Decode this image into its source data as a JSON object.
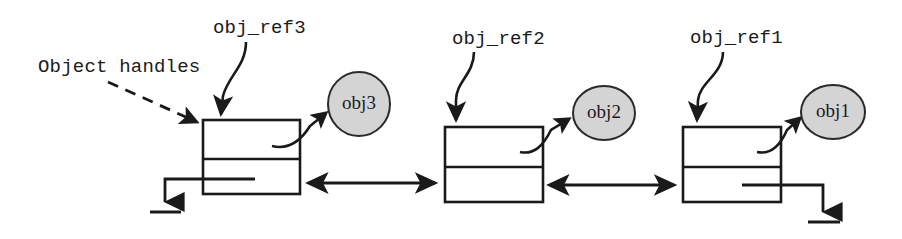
{
  "diagram": {
    "canvas": {
      "width": 902,
      "height": 239,
      "background": "#ffffff"
    },
    "colors": {
      "stroke": "#1a1a1a",
      "node_fill": "#d4d4d4",
      "node_stroke": "#2a2a2a",
      "box_fill": "#ffffff",
      "page_background": "#ffffff"
    },
    "annotations": {
      "object_handles": {
        "text": "Object handles",
        "x": 38,
        "y": 72,
        "points_to": "handle-box-3"
      }
    },
    "reference_labels": [
      {
        "id": "obj_ref3",
        "text": "obj_ref3",
        "x": 213,
        "y": 33
      },
      {
        "id": "obj_ref2",
        "text": "obj_ref2",
        "x": 452,
        "y": 44
      },
      {
        "id": "obj_ref1",
        "text": "obj_ref1",
        "x": 690,
        "y": 43
      }
    ],
    "handle_boxes": [
      {
        "id": "handle-box-3",
        "x": 203,
        "y": 120,
        "width": 97,
        "height": 74,
        "divider_y": 159,
        "points_to_object": "obj3",
        "terminator": "ground-left"
      },
      {
        "id": "handle-box-2",
        "x": 445,
        "y": 127,
        "width": 98,
        "height": 75,
        "divider_y": 167,
        "points_to_object": "obj2",
        "terminator": "none"
      },
      {
        "id": "handle-box-1",
        "x": 683,
        "y": 127,
        "width": 98,
        "height": 75,
        "divider_y": 167,
        "points_to_object": "obj1",
        "terminator": "ground-right"
      }
    ],
    "objects": [
      {
        "id": "obj3",
        "label": "obj3",
        "cx": 359,
        "cy": 104,
        "rx": 31,
        "ry": 32
      },
      {
        "id": "obj2",
        "label": "obj2",
        "cx": 604,
        "cy": 113,
        "rx": 31,
        "ry": 27
      },
      {
        "id": "obj1",
        "label": "obj1",
        "cx": 833,
        "cy": 112,
        "rx": 32,
        "ry": 27
      }
    ],
    "links": [
      {
        "id": "link-3-2",
        "from": "handle-box-3",
        "to": "handle-box-2",
        "x1": 307,
        "x2": 437,
        "y": 183,
        "style": "double-arrow"
      },
      {
        "id": "link-2-1",
        "from": "handle-box-2",
        "to": "handle-box-1",
        "x1": 548,
        "x2": 676,
        "y": 185,
        "style": "double-arrow"
      }
    ],
    "grounds": [
      {
        "id": "ground-left",
        "x": 165,
        "y": 212,
        "attached_to": "handle-box-3"
      },
      {
        "id": "ground-right",
        "x": 823,
        "y": 222,
        "attached_to": "handle-box-1"
      }
    ]
  }
}
